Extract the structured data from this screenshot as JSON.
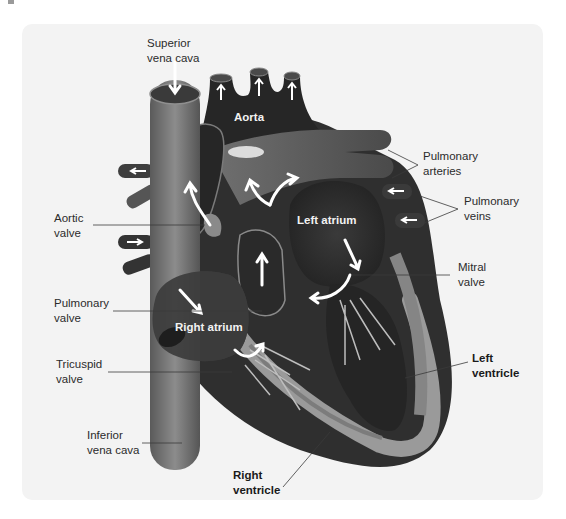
{
  "diagram": {
    "colors": {
      "background": "#ffffff",
      "card": "#f3f3f3",
      "chamber_dark": "#2e2e2e",
      "wall_mid": "#6a6a6a",
      "wall_light": "#9c9c9c",
      "vessel": "#7a7a7a",
      "arrow": "#ffffff",
      "label_text": "#2b2b2b"
    },
    "outer_labels": {
      "superior_vena_cava": "Superior\nvena cava",
      "pulmonary_arteries": "Pulmonary\narteries",
      "pulmonary_veins": "Pulmonary\nveins",
      "aortic_valve": "Aortic\nvalve",
      "mitral_valve": "Mitral\nvalve",
      "pulmonary_valve": "Pulmonary\nvalve",
      "tricuspid_valve": "Tricuspid\nvalve",
      "left_ventricle": "Left\nventricle",
      "inferior_vena_cava": "Inferior\nvena cava",
      "right_ventricle": "Right\nventricle"
    },
    "inner_labels": {
      "aorta": "Aorta",
      "left_atrium": "Left atrium",
      "right_atrium": "Right atrium"
    }
  }
}
